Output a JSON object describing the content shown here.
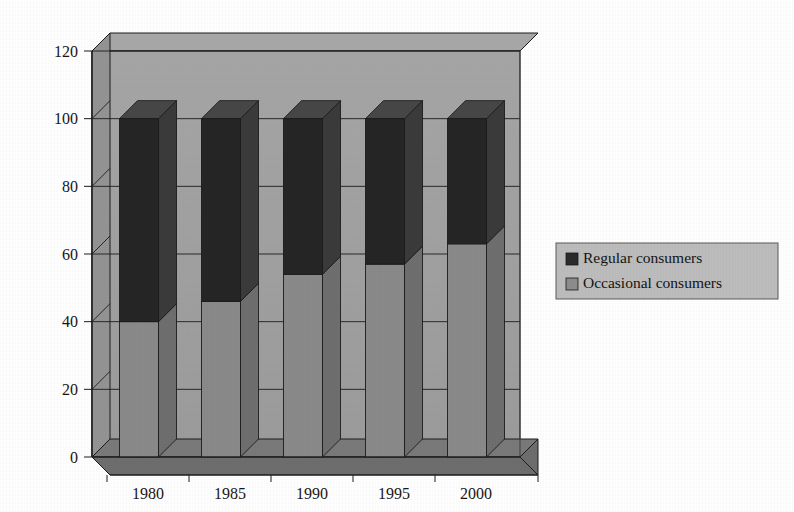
{
  "chart_data": {
    "type": "bar",
    "subtype": "stacked-column-3d",
    "title": "",
    "subtitle": "",
    "xlabel": "",
    "ylabel": "",
    "categories": [
      "1980",
      "1985",
      "1990",
      "1995",
      "2000"
    ],
    "series": [
      {
        "name": "Occasional consumers",
        "color": "#8a8a8a",
        "values": [
          40,
          46,
          54,
          57,
          63
        ]
      },
      {
        "name": "Regular consumers",
        "color": "#262626",
        "values": [
          60,
          54,
          46,
          43,
          37
        ]
      }
    ],
    "stack_totals": [
      100,
      100,
      100,
      100,
      100
    ],
    "ylim": [
      0,
      120
    ],
    "ytick_values": [
      0,
      20,
      40,
      60,
      80,
      100,
      120
    ],
    "ytick_labels": [
      "0",
      "20",
      "40",
      "60",
      "80",
      "100",
      "120"
    ],
    "xtick_labels": [
      "1980",
      "1985",
      "1990",
      "1995",
      "2000"
    ],
    "grid": true,
    "grid_axis": "y",
    "legend_position": "right",
    "legend_entries": [
      {
        "label": "Regular consumers",
        "swatch_color": "#2b2b2b"
      },
      {
        "label": "Occasional consumers",
        "swatch_color": "#8d8d8d"
      }
    ]
  },
  "palette": {
    "page_background": "#ffffff",
    "wall_fill": "#a2a2a2",
    "wall_top_fill": "#a8a8a8",
    "side_wall_fill": "#949494",
    "floor_fill": "#6e6e6e",
    "floor_top_fill": "#7a7a7a",
    "outline": "#1c1c1c",
    "dark_series": "#262626",
    "dark_series_side": "#3b3b3b",
    "dark_series_top": "#474747",
    "light_series": "#8a8a8a",
    "light_series_side": "#6f6f6f",
    "light_series_top": "#9c9c9c",
    "legend_border": "#5a5a5a",
    "legend_background": "#bdbdbd",
    "text": "#171717"
  }
}
